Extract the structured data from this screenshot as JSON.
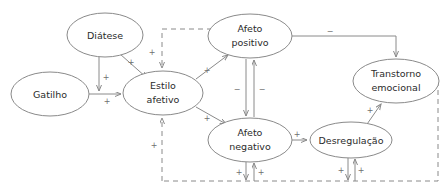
{
  "diagram": {
    "stroke_color": "#8a8a8a",
    "text_color": "#2b2b2b",
    "sign_color": "#6f6f6f",
    "background": "#ffffff",
    "nodes": [
      {
        "id": "diatese",
        "label": "Diátese",
        "line1": "Diátese",
        "line2": "",
        "cx": 105,
        "cy": 35,
        "rx": 38,
        "ry": 22
      },
      {
        "id": "gatilho",
        "label": "Gatilho",
        "line1": "Gatilho",
        "line2": "",
        "cx": 50,
        "cy": 94,
        "rx": 39,
        "ry": 22
      },
      {
        "id": "estilo",
        "label": "Estilo afetivo",
        "line1": "Estilo",
        "line2": "afetivo",
        "cx": 163,
        "cy": 93,
        "rx": 40,
        "ry": 22
      },
      {
        "id": "positivo",
        "label": "Afeto positivo",
        "line1": "Afeto",
        "line2": "positivo",
        "cx": 250,
        "cy": 36,
        "rx": 42,
        "ry": 22
      },
      {
        "id": "negativo",
        "label": "Afeto negativo",
        "line1": "Afeto",
        "line2": "negativo",
        "cx": 250,
        "cy": 140,
        "rx": 42,
        "ry": 22
      },
      {
        "id": "desregul",
        "label": "Desregulação",
        "line1": "Desregulação",
        "line2": "",
        "cx": 351,
        "cy": 140,
        "rx": 41,
        "ry": 18
      },
      {
        "id": "transtorno",
        "label": "Transtorno emocional",
        "line1": "Transtorno",
        "line2": "emocional",
        "cx": 396,
        "cy": 81,
        "rx": 43,
        "ry": 22
      }
    ],
    "edges": [
      {
        "id": "diatese-to-estilo",
        "from": "diatese",
        "to": "estilo",
        "style": "solid",
        "sign": "+"
      },
      {
        "id": "diatese-to-gatilho-path",
        "from": "diatese",
        "to": "gatilho",
        "style": "solid",
        "sign": "+"
      },
      {
        "id": "gatilho-to-estilo",
        "from": "gatilho",
        "to": "estilo",
        "style": "solid",
        "sign": "+"
      },
      {
        "id": "estilo-to-positivo",
        "from": "estilo",
        "to": "positivo",
        "style": "solid",
        "sign": "+"
      },
      {
        "id": "estilo-to-negativo",
        "from": "estilo",
        "to": "negativo",
        "style": "solid",
        "sign": "+"
      },
      {
        "id": "positivo-to-negativo",
        "from": "positivo",
        "to": "negativo",
        "style": "solid",
        "sign": "-"
      },
      {
        "id": "negativo-to-positivo",
        "from": "negativo",
        "to": "positivo",
        "style": "solid",
        "sign": "-"
      },
      {
        "id": "positivo-to-transtorno",
        "from": "positivo",
        "to": "transtorno",
        "style": "solid",
        "sign": "-"
      },
      {
        "id": "negativo-to-desregulacao",
        "from": "negativo",
        "to": "desregul",
        "style": "solid",
        "sign": "+"
      },
      {
        "id": "desregulacao-to-transtorno",
        "from": "desregul",
        "to": "transtorno",
        "style": "solid",
        "sign": "+"
      },
      {
        "id": "feedback-to-estilo",
        "from": "feedback",
        "to": "estilo",
        "style": "dashed",
        "sign": "+"
      },
      {
        "id": "dashed-positivo-to-estilo",
        "from": "positivo",
        "to": "estilo",
        "style": "dashed",
        "sign": "+"
      },
      {
        "id": "feedback-negativo-down",
        "from": "negativo",
        "to": "feedback",
        "style": "solid",
        "sign": "+"
      },
      {
        "id": "feedback-negativo-up",
        "from": "feedback",
        "to": "negativo",
        "style": "solid",
        "sign": "+"
      },
      {
        "id": "feedback-desregul-down",
        "from": "desregul",
        "to": "feedback",
        "style": "solid",
        "sign": "+"
      },
      {
        "id": "feedback-desregul-up",
        "from": "feedback",
        "to": "desregul",
        "style": "solid",
        "sign": "+"
      }
    ],
    "signs": [
      {
        "id": "sign-diatese-estilo",
        "text": "+",
        "x": 131,
        "y": 62
      },
      {
        "id": "sign-diatese-down",
        "text": "+",
        "x": 106,
        "y": 77
      },
      {
        "id": "sign-gatilho-estilo",
        "text": "+",
        "x": 107,
        "y": 101
      },
      {
        "id": "sign-estilo-positivo",
        "text": "+",
        "x": 207,
        "y": 70
      },
      {
        "id": "sign-estilo-negativo",
        "text": "+",
        "x": 207,
        "y": 118
      },
      {
        "id": "sign-positivo-negativo-left",
        "text": "−",
        "x": 237,
        "y": 89
      },
      {
        "id": "sign-positivo-negativo-right",
        "text": "−",
        "x": 262,
        "y": 89
      },
      {
        "id": "sign-positivo-transtorno",
        "text": "−",
        "x": 330,
        "y": 31
      },
      {
        "id": "sign-negativo-desregul",
        "text": "+",
        "x": 297,
        "y": 134
      },
      {
        "id": "sign-desregul-transtorno",
        "text": "+",
        "x": 370,
        "y": 110
      },
      {
        "id": "sign-dashed-positivo-estilo",
        "text": "+",
        "x": 162,
        "y": 52
      },
      {
        "id": "sign-feedback-estilo",
        "text": "+",
        "x": 154,
        "y": 145
      },
      {
        "id": "sign-feedback-neg-left",
        "text": "+",
        "x": 239,
        "y": 172
      },
      {
        "id": "sign-feedback-neg-right",
        "text": "+",
        "x": 261,
        "y": 172
      },
      {
        "id": "sign-feedback-des-left",
        "text": "+",
        "x": 341,
        "y": 170
      },
      {
        "id": "sign-feedback-des-right",
        "text": "+",
        "x": 361,
        "y": 170
      }
    ]
  }
}
